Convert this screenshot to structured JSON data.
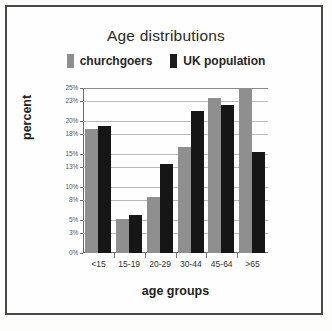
{
  "chart_data": {
    "type": "bar",
    "title": "Age distributions",
    "xlabel": "age groups",
    "ylabel": "percent",
    "categories": [
      "<15",
      "15-19",
      "20-29",
      "30-44",
      "45-64",
      ">65"
    ],
    "series": [
      {
        "name": "churchgoers",
        "color": "#8f8f8f",
        "values": [
          18.8,
          5.2,
          8.5,
          16.0,
          23.5,
          25.0
        ]
      },
      {
        "name": "UK population",
        "color": "#161616",
        "values": [
          19.3,
          5.7,
          13.5,
          21.5,
          22.5,
          15.3
        ]
      }
    ],
    "ylim": [
      0,
      25
    ],
    "ytick_labels": [
      "25%",
      "23%",
      "20%",
      "18%",
      "15%",
      "13%",
      "10%",
      "8%",
      "5%",
      "3%",
      "0%"
    ],
    "ytick_values": [
      25,
      23,
      20,
      18,
      15,
      13,
      10,
      8,
      5,
      3,
      0
    ],
    "grid": true,
    "legend_position": "top"
  },
  "legend": {
    "items": [
      {
        "label": "churchgoers"
      },
      {
        "label": "UK population"
      }
    ]
  }
}
